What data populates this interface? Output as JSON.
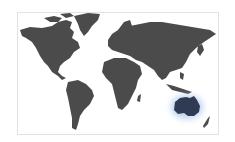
{
  "map": {
    "type": "world-map",
    "highlighted_region": "Australia",
    "colors": {
      "land": "#4b4b4b",
      "highlight": "#2f3b52",
      "highlight_glow": "#a9c4ea",
      "background": "#ffffff",
      "frame_border": "#e2e2e2"
    },
    "regions": [
      "North America",
      "Greenland",
      "South America",
      "Europe",
      "Africa",
      "Asia",
      "Indonesia",
      "Australia",
      "New Zealand"
    ]
  }
}
